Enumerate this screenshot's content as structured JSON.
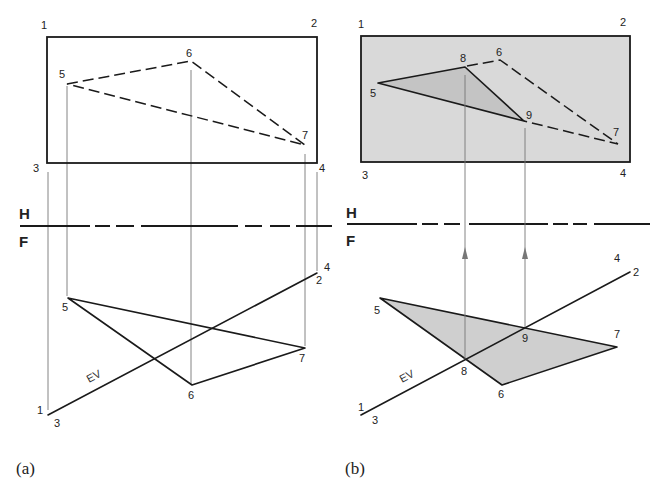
{
  "figure": {
    "panels": [
      {
        "id": "a",
        "caption": "(a)",
        "plane_labels": {
          "upper": "H",
          "lower": "F"
        },
        "plane_corner_labels": [
          "1",
          "2",
          "3",
          "4"
        ],
        "top_view_point_labels": [
          "5",
          "6",
          "7"
        ],
        "front_view_point_labels": [
          "5",
          "6",
          "7"
        ],
        "edge_view_labels": {
          "left_upper": "1",
          "left_lower": "3",
          "right_upper": "4",
          "right_lower": "2",
          "ev": "EV"
        },
        "top_view_shaded": false
      },
      {
        "id": "b",
        "caption": "(b)",
        "plane_labels": {
          "upper": "H",
          "lower": "F"
        },
        "plane_corner_labels": [
          "1",
          "2",
          "3",
          "4"
        ],
        "top_view_point_labels": [
          "5",
          "8",
          "6",
          "9",
          "7"
        ],
        "front_view_point_labels": [
          "5",
          "8",
          "9",
          "6",
          "7"
        ],
        "edge_view_labels": {
          "left_upper": "1",
          "left_lower": "3",
          "right_upper": "4",
          "right_lower": "2",
          "ev": "EV"
        },
        "top_view_shaded": true
      }
    ],
    "colors": {
      "ink": "#1a1a1a",
      "shade_plane": "#d9d9d9",
      "shade_triangle": "#c4c4c4",
      "projector": "#777777",
      "background": "#ffffff"
    }
  }
}
